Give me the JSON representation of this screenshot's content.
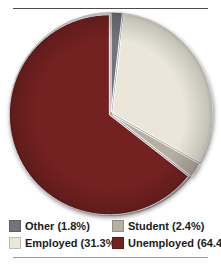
{
  "chart_data": {
    "type": "pie",
    "title": "",
    "categories": [
      "Other",
      "Employed",
      "Student",
      "Unemployed"
    ],
    "values": [
      1.8,
      31.3,
      2.4,
      64.4
    ],
    "slices": [
      {
        "label": "Other",
        "value": 1.8,
        "color": "#73737b"
      },
      {
        "label": "Employed",
        "value": 31.3,
        "color": "#eae7da"
      },
      {
        "label": "Student",
        "value": 2.4,
        "color": "#b7afa2"
      },
      {
        "label": "Unemployed",
        "value": 64.4,
        "color": "#742121"
      }
    ],
    "start_angle_deg": 0,
    "direction": "clockwise",
    "exploded": true,
    "legend_position": "bottom"
  },
  "legend": {
    "items": [
      {
        "label": "Other (1.8%)",
        "color": "#73737b"
      },
      {
        "label": "Student (2.4%)",
        "color": "#b7afa2"
      },
      {
        "label": "Employed (31.3%)",
        "color": "#eae7da"
      },
      {
        "label": "Unemployed (64.4%)",
        "color": "#742121"
      }
    ]
  }
}
